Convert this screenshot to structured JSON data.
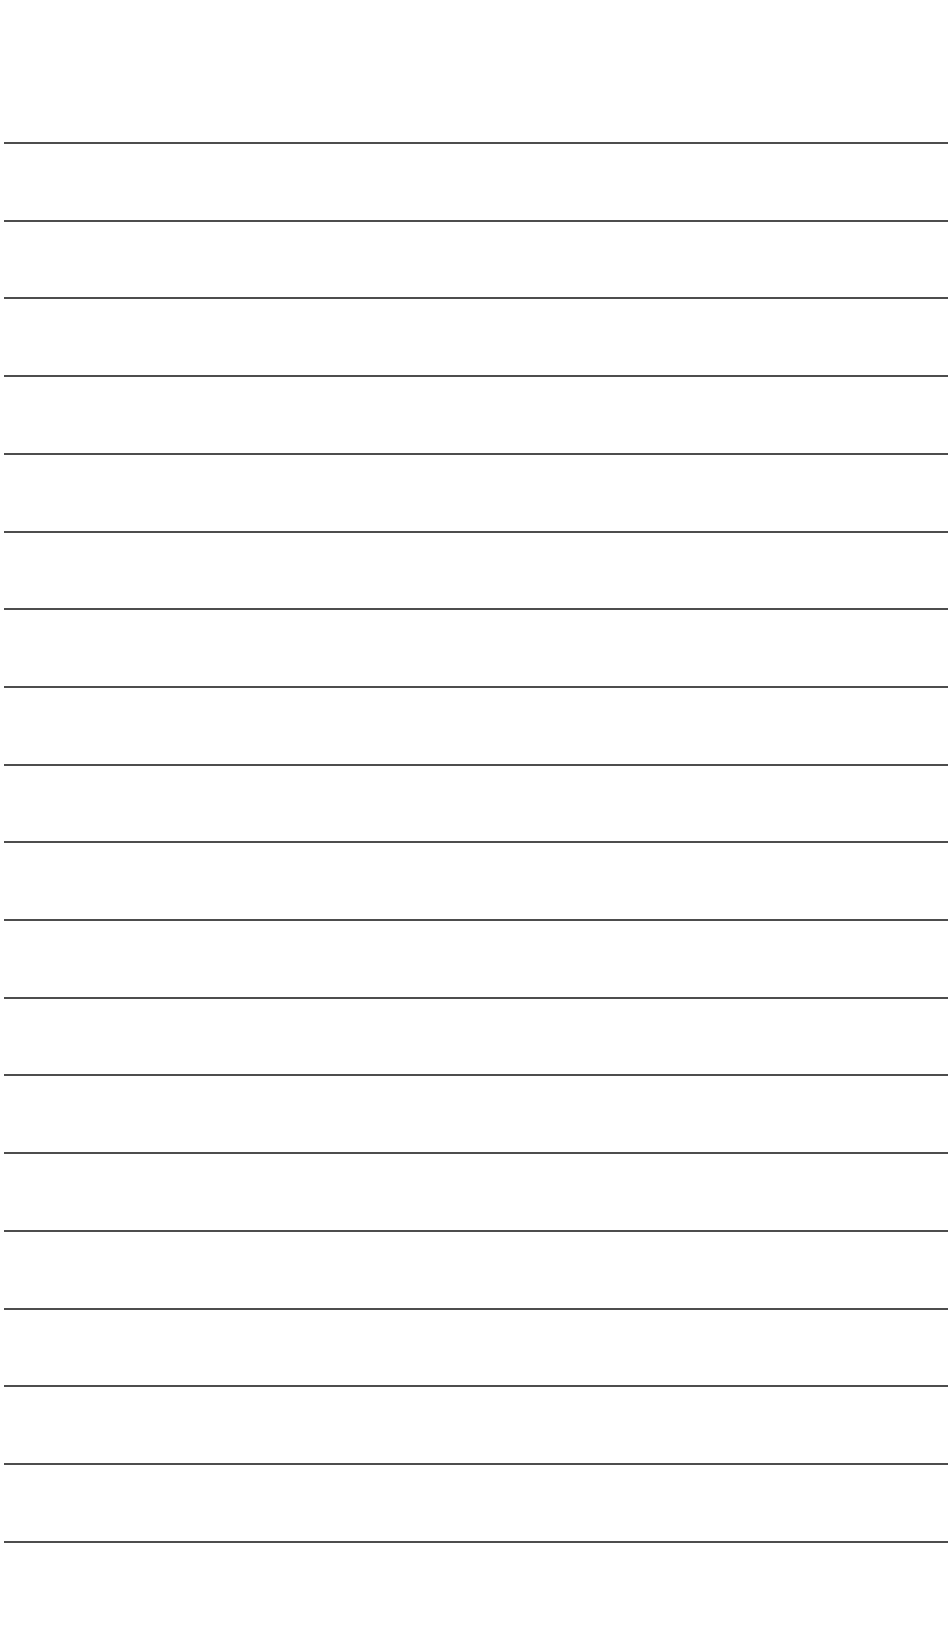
{
  "page": {
    "type": "lined-paper",
    "background_color": "#ffffff",
    "rule_color": "#3a3a3a",
    "rule_count": 19,
    "first_rule_y": 143,
    "rule_spacing": 77.7,
    "rule_left": 4,
    "rule_width": 944
  }
}
